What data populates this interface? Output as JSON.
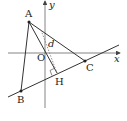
{
  "diagram": {
    "type": "coordinate-geometry",
    "axes": {
      "x_label": "x",
      "y_label": "y",
      "origin_label": "O"
    },
    "points": {
      "A": {
        "label": "A"
      },
      "B": {
        "label": "B"
      },
      "C": {
        "label": "C"
      },
      "H": {
        "label": "H"
      }
    },
    "distance_label": "d",
    "colors": {
      "line": "#333333",
      "dashed": "#777777"
    }
  }
}
